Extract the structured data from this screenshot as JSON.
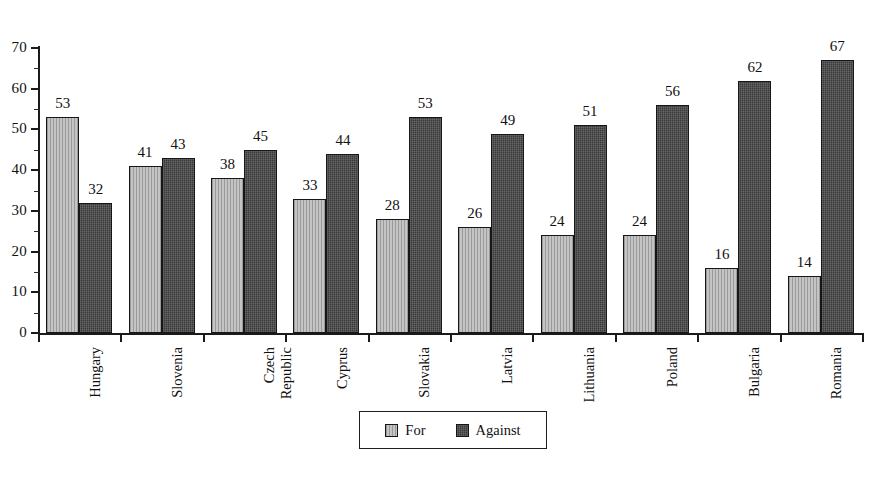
{
  "chart_data": {
    "type": "bar",
    "title": "",
    "subtitle": "",
    "xlabel": "",
    "ylabel": "",
    "ylim": [
      0,
      70
    ],
    "ytick_step": 10,
    "yticks": [
      0,
      10,
      20,
      30,
      40,
      50,
      60,
      70
    ],
    "minor_ticks": true,
    "grid": false,
    "legend_position": "bottom-center",
    "categories": [
      "Hungary",
      "Slovenia",
      "Czech Republic",
      "Cyprus",
      "Slovakia",
      "Latvia",
      "Lithuania",
      "Poland",
      "Bulgaria",
      "Romania"
    ],
    "series": [
      {
        "name": "For",
        "color": "#b4b4b4",
        "values": [
          53,
          41,
          38,
          33,
          28,
          26,
          24,
          24,
          16,
          14
        ]
      },
      {
        "name": "Against",
        "color": "#3a3a3a",
        "values": [
          32,
          43,
          45,
          44,
          53,
          49,
          51,
          56,
          62,
          67
        ]
      }
    ],
    "data_labels": true
  },
  "legend": {
    "items": [
      {
        "label": "For",
        "swatch": "light-hatch-swatch"
      },
      {
        "label": "Against",
        "swatch": "dark-hatch-swatch"
      }
    ]
  },
  "caption": {
    "text": ""
  },
  "category_label_lines": [
    [
      "Hungary"
    ],
    [
      "Slovenia"
    ],
    [
      "Czech",
      "Republic"
    ],
    [
      "Cyprus"
    ],
    [
      "Slovakia"
    ],
    [
      "Latvia"
    ],
    [
      "Lithuania"
    ],
    [
      "Poland"
    ],
    [
      "Bulgaria"
    ],
    [
      "Romania"
    ]
  ]
}
